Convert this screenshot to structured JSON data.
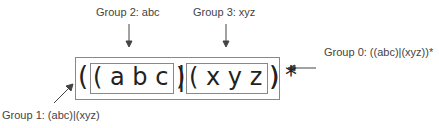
{
  "labels": {
    "group2": "Group 2: abc",
    "group3": "Group 3: xyz",
    "group0": "Group 0: ((abc)|(xyz))*",
    "group1": "Group 1: (abc)|(xyz)"
  },
  "regex": {
    "outer_open": "(",
    "g2_text": "( a b c )",
    "pipe": "|",
    "g3_text": "( x y z )",
    "outer_close": ")",
    "star": "*"
  }
}
